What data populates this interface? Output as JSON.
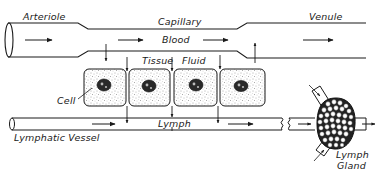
{
  "diagram": {
    "type": "biology-schematic",
    "labels": {
      "arteriole": "Arteriole",
      "capillary": "Capillary",
      "venule": "Venule",
      "blood": "Blood",
      "tissue": "Tissue",
      "fluid": "Fluid",
      "cell": "Cell",
      "lymph": "Lymph",
      "lymphatic_vessel": "Lymphatic Vessel",
      "lymph_gland_line1": "Lymph",
      "lymph_gland_line2": "Gland"
    },
    "caption": "",
    "components": [
      {
        "name": "Arteriole",
        "role": "blood vessel entering capillary",
        "flow": "left-to-right"
      },
      {
        "name": "Capillary",
        "role": "narrow vessel carrying blood",
        "flow": "left-to-right"
      },
      {
        "name": "Venule",
        "role": "blood vessel leaving capillary",
        "flow": "left-to-right"
      },
      {
        "name": "Tissue Fluid",
        "role": "fluid bathing cells between capillary and lymphatic"
      },
      {
        "name": "Cell",
        "count": 4
      },
      {
        "name": "Lymphatic Vessel",
        "role": "carries lymph",
        "flow": "left-to-right"
      },
      {
        "name": "Lymph Gland",
        "role": "node with afferent vessels"
      }
    ],
    "flows": [
      {
        "from": "Capillary",
        "to": "Tissue Fluid",
        "direction": "down",
        "count": 2
      },
      {
        "from": "Tissue Fluid",
        "to": "Capillary",
        "direction": "up",
        "count": 1
      },
      {
        "from": "Tissue Fluid",
        "to": "Lymphatic Vessel",
        "direction": "down",
        "count": 3
      },
      {
        "from": "Lymphatic Vessel",
        "to": "Lymph Gland",
        "direction": "right"
      }
    ],
    "colors": {
      "ink": "#1a1a1a",
      "background": "#ffffff",
      "stipple": "#555555"
    }
  }
}
